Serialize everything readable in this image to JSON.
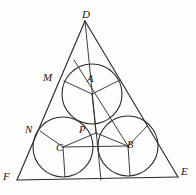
{
  "figure": {
    "canvas": {
      "width": 196,
      "height": 195
    },
    "stroke_color": "#2b2b2b",
    "background_color": "#fdfdfb"
  },
  "labels": {
    "D": "D",
    "E": "E",
    "F": "F",
    "M": "M",
    "N": "N",
    "A": "A",
    "B": "B",
    "C": "C",
    "P": "P"
  },
  "label_positions": {
    "D": {
      "x": 82,
      "y": 9
    },
    "E": {
      "x": 181,
      "y": 166
    },
    "F": {
      "x": 3,
      "y": 171
    },
    "M": {
      "x": 43,
      "y": 72
    },
    "N": {
      "x": 25,
      "y": 124
    },
    "A": {
      "x": 87,
      "y": 74
    },
    "B": {
      "x": 127,
      "y": 140
    },
    "C": {
      "x": 56,
      "y": 143
    },
    "P": {
      "x": 79,
      "y": 125
    }
  },
  "triangle": {
    "name": "DEF",
    "vertices": {
      "D": {
        "x": 85,
        "y": 21
      },
      "E": {
        "x": 178,
        "y": 177
      },
      "F": {
        "x": 17,
        "y": 180
      }
    },
    "sides": [
      "DF",
      "DE",
      "FE"
    ]
  },
  "circles": [
    {
      "name": "A",
      "cx": 92,
      "cy": 94,
      "r": 30
    },
    {
      "name": "B",
      "cx": 128,
      "cy": 146,
      "r": 30
    },
    {
      "name": "C",
      "cx": 63,
      "cy": 147,
      "r": 30
    }
  ],
  "points": {
    "P": {
      "x": 96,
      "y": 133,
      "note": "intersection junction of circles"
    },
    "M": {
      "x": 64,
      "y": 81,
      "note": "tangent point of circle A on side DF"
    },
    "N": {
      "x": 40,
      "y": 131,
      "note": "tangent point of circle C on side DF"
    },
    "tangent_A_DE": {
      "x": 120,
      "y": 80,
      "note": "tangent point of circle A on side DE"
    },
    "tangent_B_DE": {
      "x": 149,
      "y": 124,
      "note": "tangent point of circle B on side DE"
    },
    "tangent_B_FE": {
      "x": 130,
      "y": 176,
      "note": "tangent point of circle B on base FE"
    },
    "tangent_C_FE": {
      "x": 65,
      "y": 177,
      "note": "tangent point of circle C on base FE"
    }
  },
  "radii_segments": [
    {
      "from": "A",
      "to": "M"
    },
    {
      "from": "A",
      "to": "tangent_A_DE"
    },
    {
      "from": "A",
      "to": "P"
    },
    {
      "from": "C",
      "to": "N"
    },
    {
      "from": "C",
      "to": "P"
    },
    {
      "from": "C",
      "to": "tangent_C_FE"
    },
    {
      "from": "B",
      "to": "P"
    },
    {
      "from": "B",
      "to": "tangent_B_DE"
    },
    {
      "from": "B",
      "to": "tangent_B_FE"
    }
  ],
  "chord_lines": [
    {
      "name": "line-D-through-P",
      "from": {
        "x": 85,
        "y": 21
      },
      "to": {
        "x": 101,
        "y": 180
      }
    },
    {
      "name": "line-B-to-upper-left",
      "from": {
        "x": 128,
        "y": 146
      },
      "to": {
        "x": 74,
        "y": 60
      }
    }
  ]
}
